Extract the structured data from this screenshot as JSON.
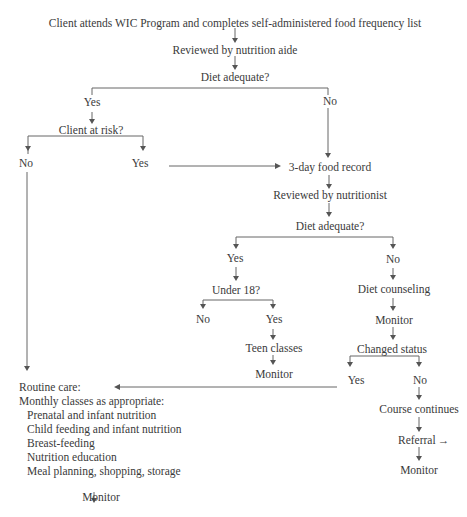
{
  "diagram": {
    "type": "flowchart",
    "nodes": {
      "start": "Client attends WIC Program and completes self-administered food frequency list",
      "review_aide": "Reviewed by nutrition aide",
      "diet_adequate_1": "Diet adequate?",
      "yes_1": "Yes",
      "no_1": "No",
      "client_at_risk": "Client at risk?",
      "risk_no": "No",
      "risk_yes": "Yes",
      "food_record": "3-day food record",
      "review_nutritionist": "Reviewed by nutritionist",
      "diet_adequate_2": "Diet adequate?",
      "yes_2": "Yes",
      "no_2": "No",
      "under_18": "Under 18?",
      "u18_no": "No",
      "u18_yes": "Yes",
      "teen_classes": "Teen classes",
      "monitor_teen": "Monitor",
      "diet_counseling": "Diet counseling",
      "monitor_counseling": "Monitor",
      "changed_status": "Changed status",
      "cs_yes": "Yes",
      "cs_no": "No",
      "course_continues": "Course continues",
      "referral": "Referral",
      "monitor_referral": "Monitor",
      "routine_care": "Routine care:",
      "monthly_classes": "Monthly classes as appropriate:",
      "classes": [
        "Prenatal and infant nutrition",
        "Child feeding and infant nutrition",
        "Breast-feeding",
        "Nutrition education",
        "Meal planning, shopping, storage"
      ],
      "monitor_routine": "Monitor"
    },
    "edges": [
      [
        "start",
        "review_aide"
      ],
      [
        "review_aide",
        "diet_adequate_1"
      ],
      [
        "diet_adequate_1",
        "yes_1"
      ],
      [
        "diet_adequate_1",
        "no_1"
      ],
      [
        "yes_1",
        "client_at_risk"
      ],
      [
        "client_at_risk",
        "risk_no"
      ],
      [
        "client_at_risk",
        "risk_yes"
      ],
      [
        "no_1",
        "food_record"
      ],
      [
        "risk_yes",
        "food_record"
      ],
      [
        "risk_no",
        "routine_care"
      ],
      [
        "food_record",
        "review_nutritionist"
      ],
      [
        "review_nutritionist",
        "diet_adequate_2"
      ],
      [
        "diet_adequate_2",
        "yes_2"
      ],
      [
        "diet_adequate_2",
        "no_2"
      ],
      [
        "yes_2",
        "under_18"
      ],
      [
        "under_18",
        "u18_no"
      ],
      [
        "under_18",
        "u18_yes"
      ],
      [
        "u18_yes",
        "teen_classes"
      ],
      [
        "teen_classes",
        "monitor_teen"
      ],
      [
        "no_2",
        "diet_counseling"
      ],
      [
        "diet_counseling",
        "monitor_counseling"
      ],
      [
        "monitor_counseling",
        "changed_status"
      ],
      [
        "changed_status",
        "cs_yes"
      ],
      [
        "changed_status",
        "cs_no"
      ],
      [
        "cs_yes",
        "routine_care"
      ],
      [
        "cs_no",
        "course_continues"
      ],
      [
        "course_continues",
        "referral"
      ],
      [
        "referral",
        "monitor_referral"
      ],
      [
        "classes",
        "monitor_routine"
      ]
    ],
    "arrow_glyph": "→"
  }
}
